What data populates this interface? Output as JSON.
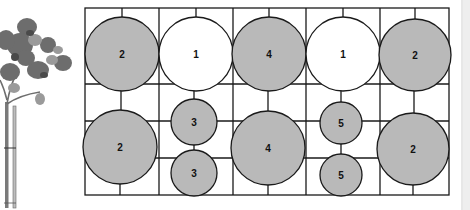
{
  "diagram": {
    "type": "planting-plan-grid",
    "colors": {
      "grid_line": "#1a1a1a",
      "filled_circle": "#b9b9b9",
      "empty_circle": "#ffffff",
      "right_bar": "#eeeeee",
      "label": "#111111"
    },
    "plants": [
      {
        "id": "c1",
        "label": "2",
        "filled": true,
        "cx": 122,
        "cy": 54,
        "r": 37
      },
      {
        "id": "c2",
        "label": "1",
        "filled": false,
        "cx": 196,
        "cy": 54,
        "r": 37
      },
      {
        "id": "c3",
        "label": "4",
        "filled": true,
        "cx": 269,
        "cy": 54,
        "r": 37
      },
      {
        "id": "c4",
        "label": "1",
        "filled": false,
        "cx": 343,
        "cy": 54,
        "r": 37
      },
      {
        "id": "c5",
        "label": "2",
        "filled": true,
        "cx": 415,
        "cy": 55,
        "r": 36
      },
      {
        "id": "c6",
        "label": "2",
        "filled": true,
        "cx": 120,
        "cy": 147,
        "r": 37
      },
      {
        "id": "c7",
        "label": "3",
        "filled": true,
        "cx": 194,
        "cy": 122,
        "r": 23
      },
      {
        "id": "c8",
        "label": "3",
        "filled": true,
        "cx": 194,
        "cy": 173,
        "r": 23
      },
      {
        "id": "c9",
        "label": "4",
        "filled": true,
        "cx": 268,
        "cy": 148,
        "r": 37
      },
      {
        "id": "c10",
        "label": "5",
        "filled": true,
        "cx": 341,
        "cy": 123,
        "r": 21
      },
      {
        "id": "c11",
        "label": "5",
        "filled": true,
        "cx": 341,
        "cy": 175,
        "r": 21
      },
      {
        "id": "c12",
        "label": "2",
        "filled": true,
        "cx": 413,
        "cy": 149,
        "r": 36
      }
    ],
    "illustration": "standard-tree-with-stake"
  }
}
